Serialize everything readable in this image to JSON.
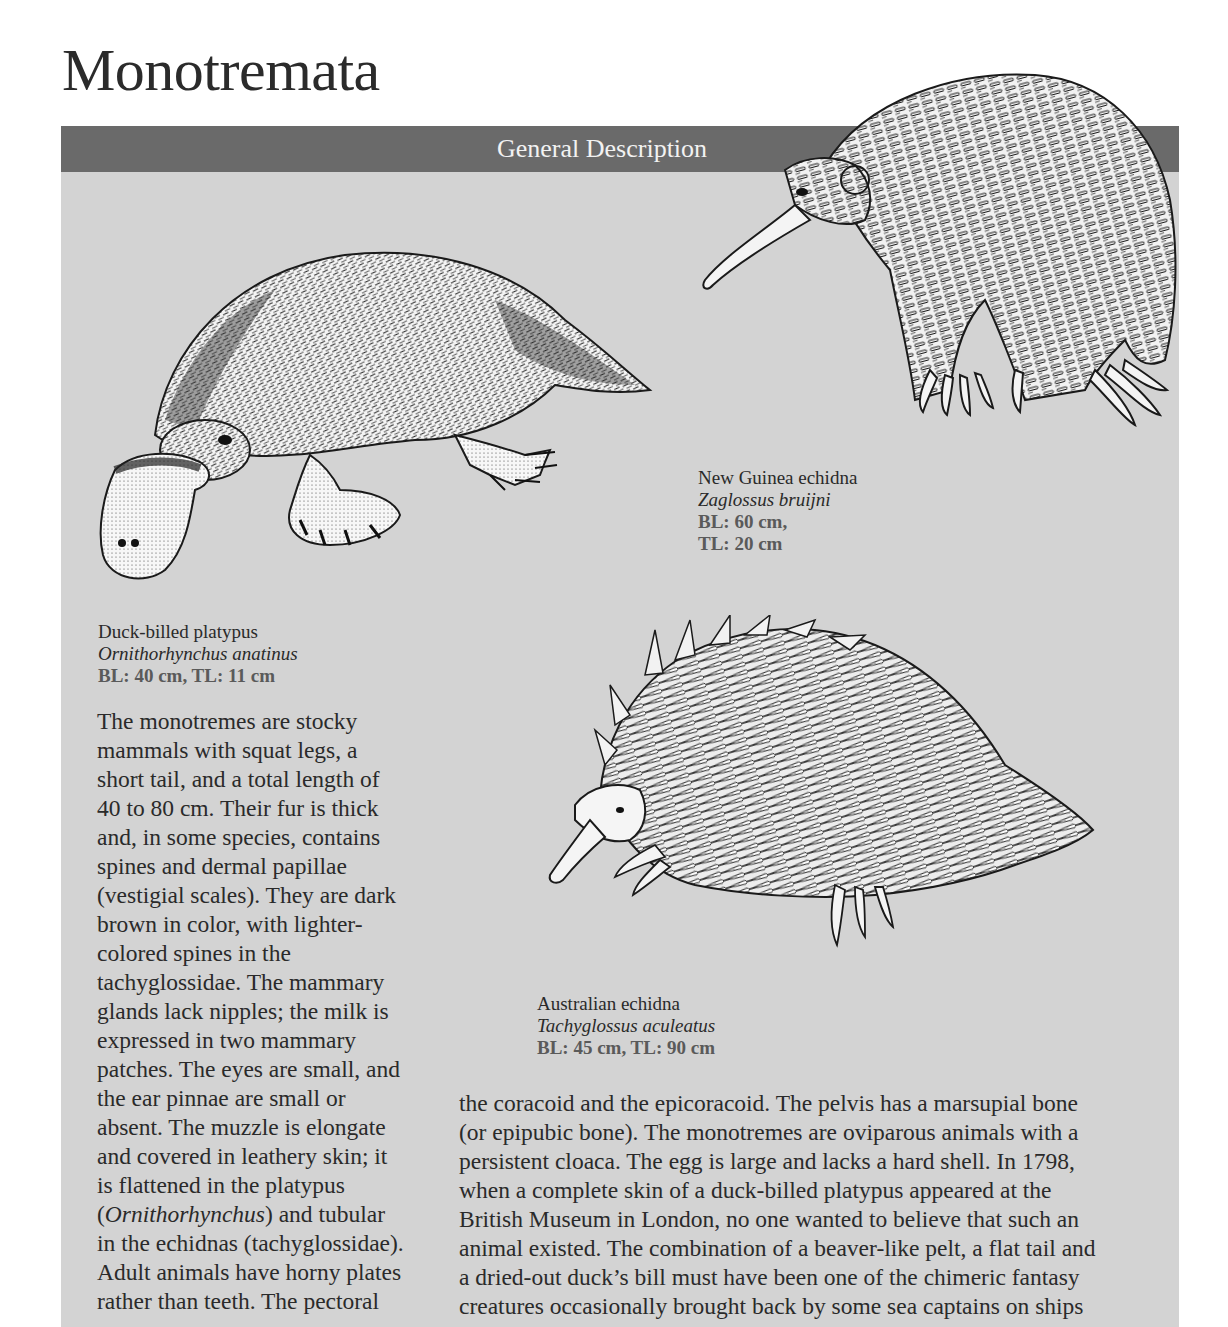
{
  "page": {
    "title": "Monotremata"
  },
  "panel": {
    "header_label": "General Description",
    "colors": {
      "header_band": "#6a6a6a",
      "panel_background": "#d3d3d3",
      "header_text": "#f2f2f2"
    }
  },
  "illustrations": [
    {
      "name": "platypus-illustration",
      "subject": "Duck-billed platypus"
    },
    {
      "name": "new-guinea-echidna-illustration",
      "subject": "New Guinea echidna"
    },
    {
      "name": "australian-echidna-illustration",
      "subject": "Australian echidna"
    }
  ],
  "captions": {
    "new_guinea_echidna": {
      "common_name": "New Guinea echidna",
      "scientific_name": "Zaglossus bruijni",
      "measurement_1": "BL: 60 cm,",
      "measurement_2": "TL: 20 cm"
    },
    "platypus": {
      "common_name": "Duck-billed platypus",
      "scientific_name": "Ornithorhynchus anatinus",
      "measurement": "BL: 40 cm, TL: 11 cm"
    },
    "australian_echidna": {
      "common_name": "Australian echidna",
      "scientific_name": "Tachyglossus aculeatus",
      "measurement": "BL: 45 cm, TL: 90 cm"
    }
  },
  "body": {
    "left_column": [
      "The monotremes are stocky",
      "mammals with squat legs, a",
      "short tail, and a total length of",
      "40 to 80 cm. Their fur is thick",
      "and, in some species, contains",
      "spines and dermal papillae",
      "(vestigial scales). They are dark",
      "brown in color, with lighter-",
      "colored spines in the",
      "tachyglossidae. The mammary",
      "glands lack nipples; the milk is",
      "expressed in two mammary",
      "patches. The eyes are small, and",
      "the ear pinnae are small or",
      "absent. The muzzle is elongate",
      "and covered in leathery skin; it",
      "is flattened in the platypus"
    ],
    "left_italic_line": {
      "open": "(",
      "italic": "Ornithorhynchus",
      "rest": ") and tubular"
    },
    "left_column_tail": [
      "in the echidnas (tachyglossidae).",
      "Adult animals have horny plates",
      "rather than teeth. The pectoral"
    ],
    "right_column": [
      "the coracoid and the epicoracoid. The pelvis has a marsupial bone",
      "(or epipubic bone). The monotremes are oviparous animals with a",
      "persistent cloaca. The egg is large and lacks a hard shell. In 1798,",
      "when a complete skin of a duck-billed platypus appeared at the",
      "British Museum in London, no one wanted to believe that such an",
      "animal existed. The combination of a beaver-like pelt, a flat tail and",
      "a dried-out duck’s bill must have been one of the chimeric fantasy",
      "creatures occasionally brought back by some sea captains on ships"
    ]
  }
}
